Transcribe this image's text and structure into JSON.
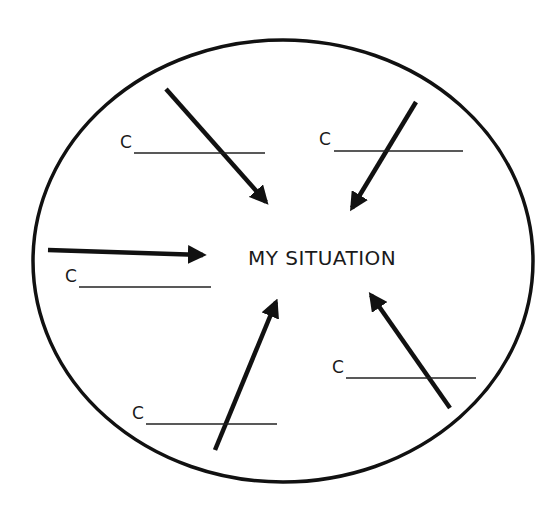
{
  "diagram": {
    "center_label": "MY SITUATION",
    "stroke_color": "#111111",
    "blanks": [
      {
        "prefix": "C",
        "position": "upper-left"
      },
      {
        "prefix": "C",
        "position": "upper-right"
      },
      {
        "prefix": "C",
        "position": "left"
      },
      {
        "prefix": "C",
        "position": "lower-right"
      },
      {
        "prefix": "C",
        "position": "lower-left"
      }
    ],
    "arrows": [
      {
        "from": "upper-left",
        "direction": "toward-center"
      },
      {
        "from": "upper-right",
        "direction": "toward-center"
      },
      {
        "from": "left",
        "direction": "toward-center"
      },
      {
        "from": "lower-left",
        "direction": "toward-center"
      },
      {
        "from": "lower-right",
        "direction": "toward-center"
      }
    ]
  }
}
